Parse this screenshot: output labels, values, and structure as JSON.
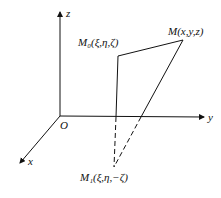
{
  "diagram": {
    "axes": {
      "z_label": "z",
      "y_label": "y",
      "x_label": "x",
      "origin_label": "O"
    },
    "points": {
      "M0": {
        "label": "M₀(ξ,η,ζ)"
      },
      "M": {
        "label": "M(x,y,z)"
      },
      "M1": {
        "label": "M₁(ξ,η,−ζ)"
      }
    },
    "colors": {
      "line": "#111111",
      "background": "#ffffff"
    }
  }
}
